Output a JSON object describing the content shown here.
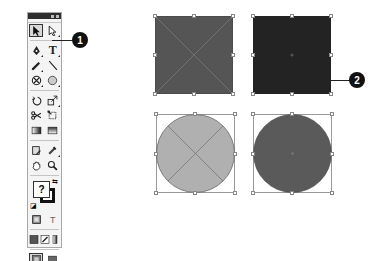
{
  "toolbar": {
    "title_buttons": [
      "collapse",
      "close"
    ],
    "rows": [
      [
        {
          "name": "selection-tool",
          "glyph": "sel",
          "selected": true
        },
        {
          "name": "direct-selection-tool",
          "glyph": "dsel"
        }
      ],
      [
        {
          "name": "pen-tool",
          "glyph": "pen"
        },
        {
          "name": "type-tool",
          "glyph": "T."
        }
      ],
      [
        {
          "name": "pencil-tool",
          "glyph": "pencil"
        },
        {
          "name": "line-tool",
          "glyph": "line"
        }
      ],
      [
        {
          "name": "rectangle-frame-tool",
          "glyph": "frame"
        },
        {
          "name": "ellipse-tool",
          "glyph": "ellipse"
        }
      ],
      [
        {
          "name": "rotate-tool",
          "glyph": "rotate"
        },
        {
          "name": "scale-tool",
          "glyph": "scale"
        }
      ],
      [
        {
          "name": "scissors-tool",
          "glyph": "scissors"
        },
        {
          "name": "free-transform-tool",
          "glyph": "freetransform"
        }
      ],
      [
        {
          "name": "gradient-swatch-tool",
          "glyph": "gradient"
        },
        {
          "name": "gradient-feather-tool",
          "glyph": "feather"
        }
      ],
      [
        {
          "name": "note-tool",
          "glyph": "note"
        },
        {
          "name": "eyedropper-tool",
          "glyph": "eyedropper"
        }
      ],
      [
        {
          "name": "hand-tool",
          "glyph": "hand"
        },
        {
          "name": "zoom-tool",
          "glyph": "zoom"
        }
      ]
    ],
    "fill_stroke": {
      "fill_label": "?",
      "swap_glyph": "⇆",
      "default_glyph": "◪"
    },
    "formatting_row": [
      {
        "name": "formatting-affects-container",
        "glyph": "container"
      },
      {
        "name": "formatting-affects-text",
        "glyph": "T"
      }
    ],
    "apply_row": [
      {
        "name": "apply-color",
        "glyph": "color"
      },
      {
        "name": "apply-gradient",
        "glyph": "gradient"
      },
      {
        "name": "apply-none",
        "glyph": "none"
      }
    ],
    "view_row": [
      {
        "name": "normal-view",
        "glyph": "normal",
        "selected": true
      },
      {
        "name": "preview-view",
        "glyph": "preview"
      }
    ]
  },
  "callouts": [
    {
      "id": "1",
      "label": "1"
    },
    {
      "id": "2",
      "label": "2"
    }
  ],
  "canvas": {
    "shapes": [
      {
        "name": "square-mid-gray",
        "type": "rect",
        "fill": "#555555",
        "diagonals": true
      },
      {
        "name": "square-dark",
        "type": "rect",
        "fill": "#232323",
        "diagonals": false
      },
      {
        "name": "circle-light-gray",
        "type": "ellipse",
        "fill": "#b0b0b0",
        "diagonals": true
      },
      {
        "name": "circle-dark-gray",
        "type": "ellipse",
        "fill": "#5a5a5a",
        "diagonals": false
      }
    ]
  },
  "colors": {
    "toolbar_bg": "#f4f4f4",
    "title_bar": "#2e2e2e",
    "callout": "#111111",
    "handle_border": "#888888"
  }
}
